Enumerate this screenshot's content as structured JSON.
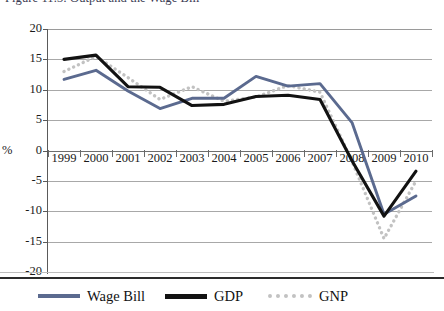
{
  "figure": {
    "title": "Figure 11.3: Output and the Wage Bill"
  },
  "axes": {
    "y_unit_label": "%",
    "y_ticks": [
      "20",
      "15",
      "10",
      "5",
      "0",
      "-5",
      "-10",
      "-15",
      "-20"
    ],
    "x_ticks": [
      "1999",
      "2000",
      "2001",
      "2002",
      "2003",
      "2004",
      "2005",
      "2006",
      "2007",
      "2008",
      "2009",
      "2010"
    ]
  },
  "legend": {
    "items": [
      {
        "label": "Wage Bill",
        "style": "solid",
        "color": "#5b6a8f"
      },
      {
        "label": "GDP",
        "style": "solid",
        "color": "#121212"
      },
      {
        "label": "GNP",
        "style": "dotted",
        "color": "#c2c2c2"
      }
    ]
  },
  "chart_data": {
    "type": "line",
    "title": "Figure 11.3: Output and the Wage Bill",
    "xlabel": "",
    "ylabel": "%",
    "ylim": [
      -20,
      20
    ],
    "ytick_step": 5,
    "grid": true,
    "legend_position": "bottom",
    "categories": [
      "1999",
      "2000",
      "2001",
      "2002",
      "2003",
      "2004",
      "2005",
      "2006",
      "2007",
      "2008",
      "2009",
      "2010"
    ],
    "series": [
      {
        "name": "Wage Bill",
        "color": "#5b6a8f",
        "style": "solid",
        "values": [
          11.7,
          13.2,
          9.8,
          6.9,
          8.6,
          8.6,
          12.2,
          10.6,
          11.0,
          4.6,
          -10.5,
          -7.5
        ]
      },
      {
        "name": "GDP",
        "color": "#121212",
        "style": "solid",
        "values": [
          15.0,
          15.7,
          10.5,
          10.4,
          7.4,
          7.6,
          8.9,
          9.1,
          8.4,
          -1.7,
          -10.8,
          -3.4
        ]
      },
      {
        "name": "GNP",
        "color": "#c2c2c2",
        "style": "dotted",
        "values": [
          13.0,
          15.5,
          12.0,
          8.4,
          10.5,
          8.1,
          8.8,
          10.7,
          9.6,
          -1.8,
          -14.5,
          -5.0
        ]
      }
    ]
  }
}
